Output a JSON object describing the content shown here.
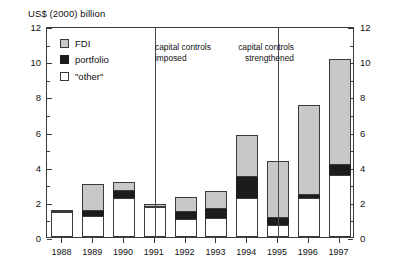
{
  "axis_unit_label": "US$ (2000) billion",
  "legend": {
    "items": [
      {
        "key": "fdi",
        "label": "FDI",
        "color": "#c8c8c8"
      },
      {
        "key": "portfolio",
        "label": "portfolio",
        "color": "#1c1c1c"
      },
      {
        "key": "other",
        "label": "\"other\"",
        "color": "#ffffff"
      }
    ]
  },
  "annotations": [
    {
      "name": "capital-controls-imposed",
      "text": "capital controls\nimposed",
      "at_year": "1991"
    },
    {
      "name": "capital-controls-strengthened",
      "text": "capital controls\nstrengthened",
      "at_year": "1995"
    }
  ],
  "yaxis": {
    "label_left": [
      "0",
      "2",
      "4",
      "6",
      "8",
      "10",
      "12"
    ],
    "label_right": [
      "0",
      "2",
      "4",
      "6",
      "8",
      "10",
      "12"
    ],
    "min": 0,
    "max": 12,
    "major_step": 2,
    "minor_step": 1
  },
  "chart_data": {
    "type": "bar",
    "title": "",
    "subtitle": "",
    "xlabel": "",
    "ylabel": "US$ (2000) billion",
    "ylim": [
      0,
      12
    ],
    "grid": false,
    "stacked": true,
    "legend_position": "top-left",
    "categories": [
      "1988",
      "1989",
      "1990",
      "1991",
      "1992",
      "1993",
      "1994",
      "1995",
      "1996",
      "1997"
    ],
    "series": [
      {
        "name": "\"other\"",
        "color": "#ffffff",
        "values": [
          1.4,
          1.2,
          2.2,
          1.7,
          1.0,
          1.1,
          2.2,
          0.7,
          2.2,
          3.5
        ]
      },
      {
        "name": "portfolio",
        "color": "#1c1c1c",
        "values": [
          0.0,
          0.3,
          0.4,
          0.0,
          0.4,
          0.5,
          1.2,
          0.4,
          0.2,
          0.6
        ]
      },
      {
        "name": "FDI",
        "color": "#c8c8c8",
        "values": [
          0.15,
          1.5,
          0.5,
          0.2,
          0.9,
          1.0,
          2.4,
          3.2,
          5.1,
          6.0
        ]
      }
    ],
    "totals": [
      1.55,
      3.0,
      3.1,
      1.9,
      2.3,
      2.6,
      5.8,
      4.3,
      7.5,
      10.1
    ],
    "vertical_markers": [
      {
        "label": "capital controls imposed",
        "at_year": "1991"
      },
      {
        "label": "capital controls strengthened",
        "at_year": "1995"
      }
    ]
  }
}
